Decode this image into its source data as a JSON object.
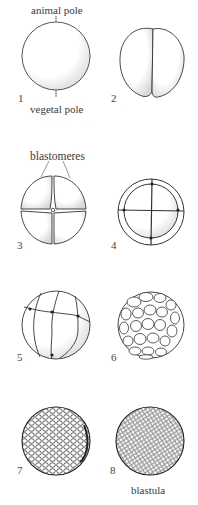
{
  "figure": {
    "labels": {
      "animal_pole": "animal pole",
      "vegetal_pole": "vegetal pole",
      "blastomeres": "blastomeres",
      "blastula": "blastula"
    },
    "stages": [
      {
        "number": "1",
        "description": "fertilized egg"
      },
      {
        "number": "2",
        "description": "2-cell stage"
      },
      {
        "number": "3",
        "description": "4-cell stage"
      },
      {
        "number": "4",
        "description": "8-cell stage"
      },
      {
        "number": "5",
        "description": "16-cell stage"
      },
      {
        "number": "6",
        "description": "32-cell stage"
      },
      {
        "number": "7",
        "description": "morula"
      },
      {
        "number": "8",
        "description": "blastula"
      }
    ],
    "colors": {
      "line": "#2b2b2b",
      "shade": "#bdbdbd",
      "background": "#ffffff"
    }
  }
}
